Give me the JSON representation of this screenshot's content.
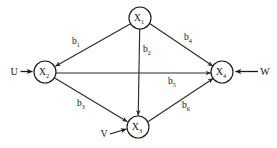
{
  "diagram": {
    "type": "path-diagram",
    "background_color": "#ffffff",
    "line_color": "#2b2b2b",
    "text_color": "#111111",
    "nodes": [
      {
        "id": "X1",
        "base": "X",
        "subscript": "1",
        "cx": 140,
        "cy": 18,
        "r": 11
      },
      {
        "id": "X2",
        "base": "X",
        "subscript": "2",
        "cx": 45,
        "cy": 72,
        "r": 11
      },
      {
        "id": "X3",
        "base": "X",
        "subscript": "3",
        "cx": 138,
        "cy": 127,
        "r": 11
      },
      {
        "id": "X4",
        "base": "X",
        "subscript": "4",
        "cx": 222,
        "cy": 72,
        "r": 11
      }
    ],
    "edges": [
      {
        "id": "b1",
        "base": "b",
        "subscript": "1",
        "from": "X1",
        "to": "X2",
        "label_x": 76,
        "label_y": 41
      },
      {
        "id": "b2",
        "base": "b",
        "subscript": "2",
        "from": "X1",
        "to": "X3",
        "label_x": 147,
        "label_y": 49
      },
      {
        "id": "b3",
        "base": "b",
        "subscript": "3",
        "from": "X2",
        "to": "X3",
        "label_x": 81,
        "label_y": 103
      },
      {
        "id": "b4",
        "base": "b",
        "subscript": "4",
        "from": "X1",
        "to": "X4",
        "label_x": 188,
        "label_y": 37
      },
      {
        "id": "b5",
        "base": "b",
        "subscript": "5",
        "from": "X2",
        "to": "X4",
        "label_x": 172,
        "label_y": 81
      },
      {
        "id": "b6",
        "base": "b",
        "subscript": "6",
        "from": "X3",
        "to": "X4",
        "label_x": 186,
        "label_y": 105
      }
    ],
    "exogenous": [
      {
        "id": "U",
        "label": "U",
        "target": "X2",
        "label_x": 14,
        "label_y": 71,
        "direction": "right"
      },
      {
        "id": "V",
        "label": "V",
        "target": "X3",
        "label_x": 104,
        "label_y": 133,
        "direction": "upright"
      },
      {
        "id": "W",
        "label": "W",
        "target": "X4",
        "label_x": 265,
        "label_y": 71,
        "direction": "left"
      }
    ]
  }
}
